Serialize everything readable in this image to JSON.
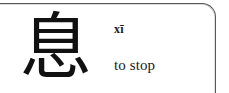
{
  "card": {
    "hanzi": "息",
    "pinyin": "xī",
    "definition": "to stop",
    "frame_color": "#595959",
    "text_color": "#1a1a1a",
    "background_color": "#ffffff"
  }
}
